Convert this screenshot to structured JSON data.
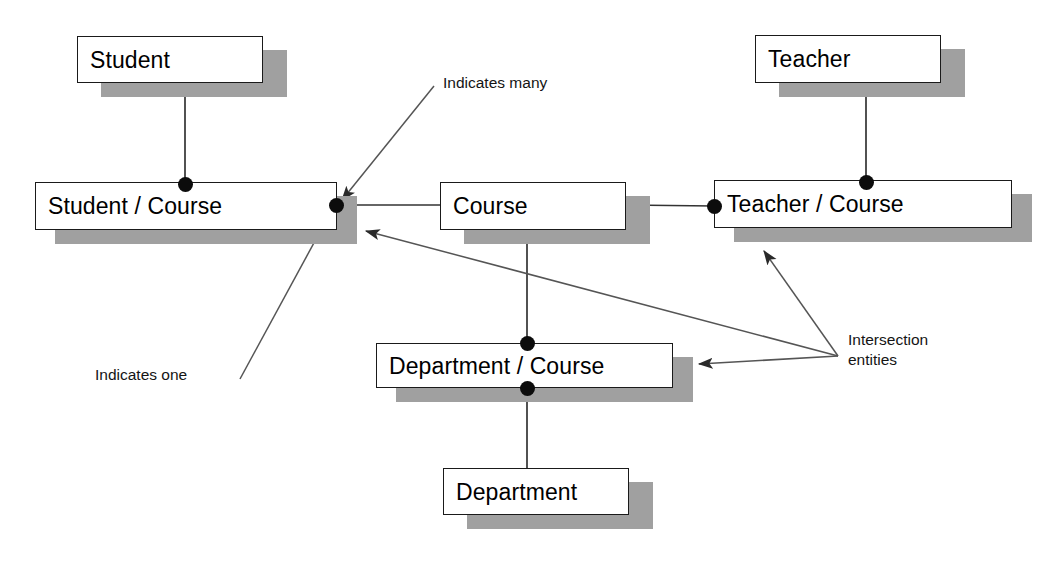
{
  "diagram": {
    "background_color": "#ffffff",
    "box_fill": "#ffffff",
    "box_border_color": "#1a1a1a",
    "shadow_color": "#a0a0a0",
    "line_color": "#444444",
    "connector_dot_color": "#0c0c0c"
  },
  "entities": [
    {
      "id": "student",
      "label": "Student",
      "x": 77,
      "y": 36,
      "w": 186,
      "h": 47,
      "shadow_dx": 24,
      "shadow_dy": 14
    },
    {
      "id": "student_course",
      "label": "Student / Course",
      "x": 35,
      "y": 182,
      "w": 302,
      "h": 48,
      "shadow_dx": 20,
      "shadow_dy": 14
    },
    {
      "id": "course",
      "label": "Course",
      "x": 440,
      "y": 182,
      "w": 186,
      "h": 48,
      "shadow_dx": 24,
      "shadow_dy": 14
    },
    {
      "id": "teacher",
      "label": "Teacher",
      "x": 755,
      "y": 35,
      "w": 186,
      "h": 48,
      "shadow_dx": 24,
      "shadow_dy": 14
    },
    {
      "id": "teacher_course",
      "label": "Teacher / Course",
      "x": 714,
      "y": 180,
      "w": 298,
      "h": 48,
      "shadow_dx": 20,
      "shadow_dy": 14
    },
    {
      "id": "department_course",
      "label": "Department / Course",
      "x": 376,
      "y": 343,
      "w": 297,
      "h": 45,
      "shadow_dx": 20,
      "shadow_dy": 14
    },
    {
      "id": "department",
      "label": "Department",
      "x": 443,
      "y": 468,
      "w": 186,
      "h": 47,
      "shadow_dx": 24,
      "shadow_dy": 14
    }
  ],
  "relationships": [
    {
      "id": "student-to-student-course",
      "from": "student",
      "to": "student_course",
      "points": [
        [
          185,
          83
        ],
        [
          185,
          182
        ]
      ]
    },
    {
      "id": "student-course-to-course",
      "from": "student_course",
      "to": "course",
      "points": [
        [
          336,
          205
        ],
        [
          440,
          205
        ]
      ]
    },
    {
      "id": "course-to-teacher-course",
      "from": "course",
      "to": "teacher_course",
      "points": [
        [
          626,
          205
        ],
        [
          714,
          206
        ]
      ]
    },
    {
      "id": "teacher-to-teacher-course",
      "from": "teacher",
      "to": "teacher_course",
      "points": [
        [
          866,
          83
        ],
        [
          866,
          180
        ]
      ]
    },
    {
      "id": "course-to-department-course",
      "from": "course",
      "to": "department_course",
      "points": [
        [
          527,
          230
        ],
        [
          527,
          343
        ]
      ]
    },
    {
      "id": "department-course-to-department",
      "from": "department_course",
      "to": "department",
      "points": [
        [
          527,
          388
        ],
        [
          527,
          468
        ]
      ]
    }
  ],
  "cardinality_dots": [
    {
      "id": "dot-student-course-top",
      "on": "student_course",
      "x": 185,
      "y": 184,
      "meaning": "one"
    },
    {
      "id": "dot-student-course-right",
      "on": "student_course",
      "x": 336,
      "y": 205,
      "meaning": "many"
    },
    {
      "id": "dot-teacher-course-left",
      "on": "teacher_course",
      "x": 714,
      "y": 206,
      "meaning": "many"
    },
    {
      "id": "dot-teacher-course-top",
      "on": "teacher_course",
      "x": 866,
      "y": 182,
      "meaning": "one"
    },
    {
      "id": "dot-department-course-top",
      "on": "department_course",
      "x": 527,
      "y": 343,
      "meaning": "many"
    },
    {
      "id": "dot-department-course-bottom",
      "on": "department_course",
      "x": 527,
      "y": 388,
      "meaning": "one"
    }
  ],
  "annotations": [
    {
      "id": "indicates-many",
      "text": "Indicates many",
      "text_x": 443,
      "text_y": 73,
      "leader": {
        "points": [
          [
            434,
            86
          ],
          [
            342,
            200
          ]
        ],
        "arrowhead": "end"
      }
    },
    {
      "id": "indicates-one",
      "text": "Indicates one",
      "text_x": 95,
      "text_y": 365,
      "leader": {
        "points": [
          [
            240,
            379
          ],
          [
            334,
            206
          ]
        ],
        "arrowhead": "none"
      }
    },
    {
      "id": "intersection-entities",
      "text": "Intersection\nentities",
      "text_x": 848,
      "text_y": 330,
      "hub": [
        838,
        356
      ],
      "leaders": [
        {
          "id": "leader-to-student-course",
          "points": [
            [
              838,
              356
            ],
            [
              366,
              231
            ]
          ],
          "arrowhead": "end"
        },
        {
          "id": "leader-to-teacher-course",
          "points": [
            [
              838,
              356
            ],
            [
              764,
              251
            ]
          ],
          "arrowhead": "end"
        },
        {
          "id": "leader-to-department-course",
          "points": [
            [
              838,
              356
            ],
            [
              699,
              364
            ]
          ],
          "arrowhead": "end"
        }
      ]
    }
  ]
}
